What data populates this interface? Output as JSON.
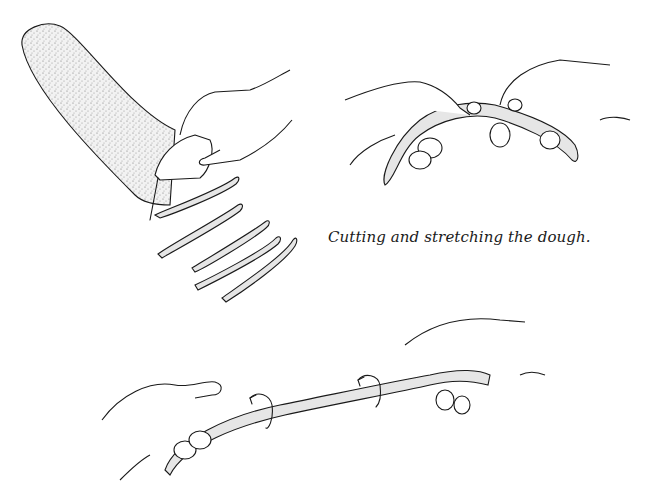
{
  "figure": {
    "caption": "Cutting and stretching the dough.",
    "panels": [
      {
        "name": "cutting-dough",
        "description": "Hand with scraper cutting strips from a loaf of dough"
      },
      {
        "name": "stretching-dough",
        "description": "Two hands stretching a dough strip"
      },
      {
        "name": "twisting-dough",
        "description": "Two hands twisting and pulling a long dough rope with rotation arrows"
      }
    ],
    "colors": {
      "ink": "#1a1a1a",
      "dough_stipple": "#e6e6e6",
      "background": "#ffffff"
    }
  }
}
